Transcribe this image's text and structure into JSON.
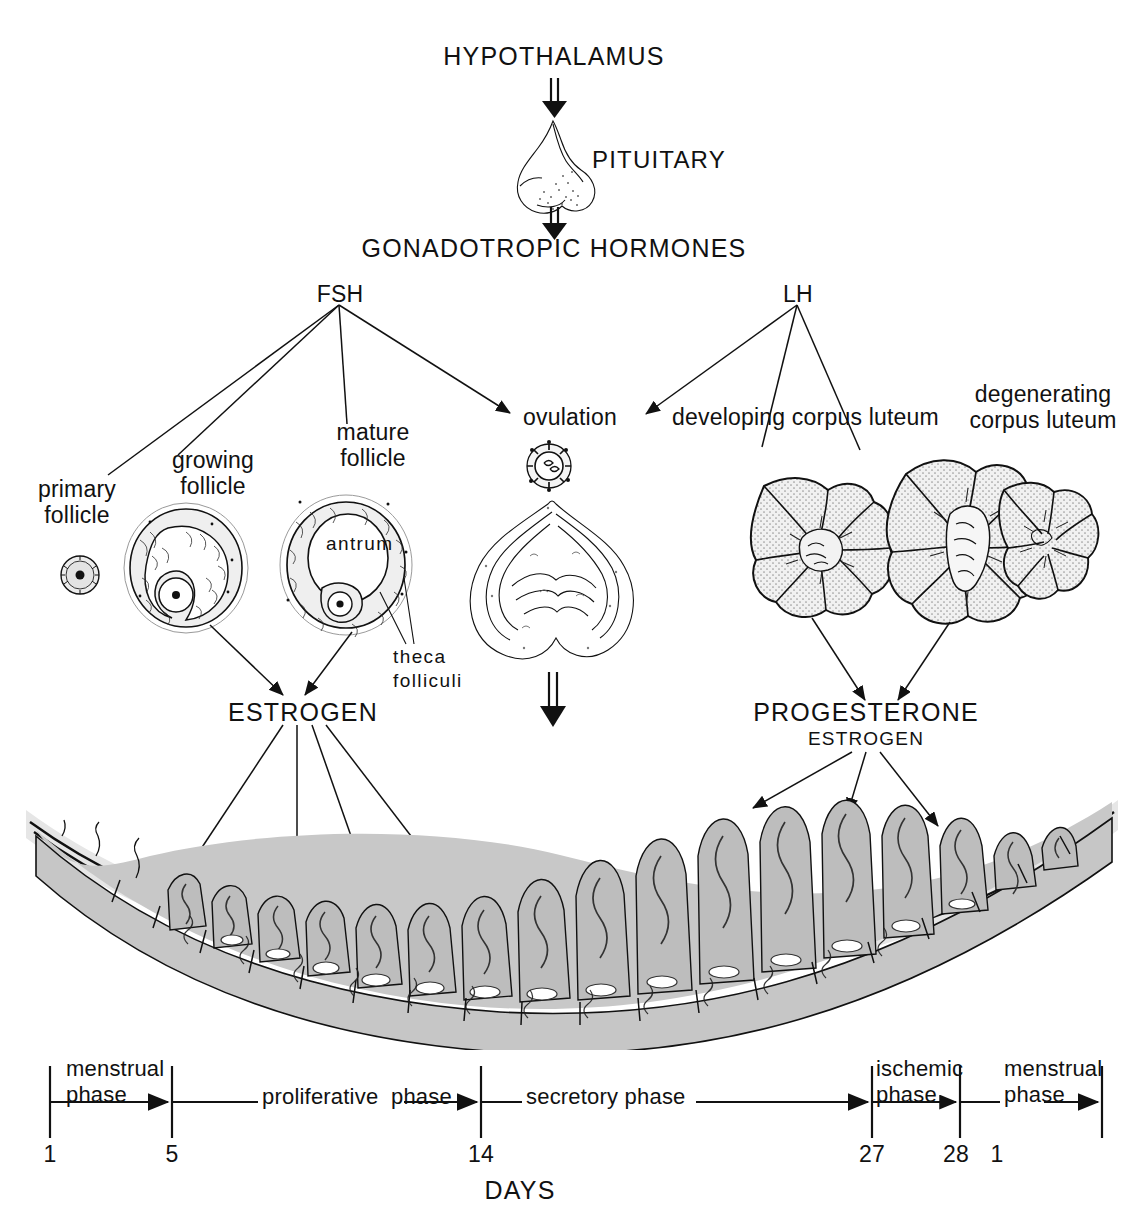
{
  "figure": {
    "type": "labeled-biological-diagram",
    "background_color": "#ffffff",
    "ink_color": "#111111",
    "tissue_color": "#c9c9c9"
  },
  "axis_chain": {
    "hypothalamus": "HYPOTHALAMUS",
    "pituitary": "PITUITARY",
    "gonadotropic_hormones": "GONADOTROPIC HORMONES",
    "fsh": "FSH",
    "lh": "LH"
  },
  "ovary_stages": [
    {
      "id": "primary-follicle",
      "label": "primary\nfollicle"
    },
    {
      "id": "growing-follicle",
      "label": "growing\nfollicle"
    },
    {
      "id": "mature-follicle",
      "label": "mature\nfollicle"
    },
    {
      "id": "ovulation",
      "label": "ovulation"
    },
    {
      "id": "developing-corpus-luteum",
      "label": "developing corpus luteum"
    },
    {
      "id": "degenerating-corpus-luteum",
      "label": "degenerating\ncorpus luteum"
    }
  ],
  "internal_labels": {
    "antrum": "antrum",
    "theca_folliculi": "theca\nfolliculi"
  },
  "hormones": {
    "estrogen": "ESTROGEN",
    "progesterone": "PROGESTERONE",
    "progesterone_secondary": "ESTROGEN"
  },
  "timeline": {
    "axis_caption": "DAYS",
    "ticks": [
      {
        "day": "1",
        "x": 50
      },
      {
        "day": "5",
        "x": 172
      },
      {
        "day": "14",
        "x": 481
      },
      {
        "day": "27",
        "x": 872
      },
      {
        "day": "28",
        "x": 960
      },
      {
        "day": "1",
        "x": 997
      }
    ],
    "phases": [
      {
        "id": "menstrual-phase-1",
        "label": "menstrual\nphase"
      },
      {
        "id": "proliferative-phase",
        "label": "proliferative  phase"
      },
      {
        "id": "secretory-phase",
        "label": "secretory phase"
      },
      {
        "id": "ischemic-phase",
        "label": "ischemic\nphase"
      },
      {
        "id": "menstrual-phase-2",
        "label": "menstrual\nphase"
      }
    ]
  },
  "endometrium": {
    "name": "uterine endometrium cross-section",
    "description": "thickening glandular lining across the cycle"
  }
}
